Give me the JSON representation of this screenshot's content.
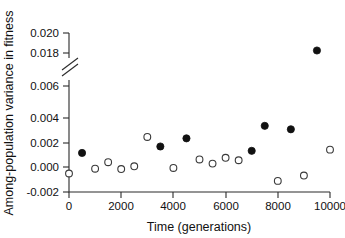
{
  "chart_data": {
    "type": "scatter",
    "title": "",
    "xlabel": "Time (generations)",
    "ylabel": "Among-population variance in fitness",
    "xlim": [
      0,
      10000
    ],
    "xticks": [
      0,
      2000,
      4000,
      6000,
      8000,
      10000
    ],
    "xticklabels": [
      "0",
      "2000",
      "4000",
      "6000",
      "8000",
      "10000"
    ],
    "yticks": [
      -0.002,
      0.0,
      0.002,
      0.004,
      0.006,
      0.018,
      0.02
    ],
    "yticklabels": [
      "-0.002",
      "0.000",
      "0.002",
      "0.004",
      "0.006",
      "0.018",
      "0.020"
    ],
    "y_axis_break": {
      "present": true,
      "between": [
        0.006,
        0.018
      ],
      "symbol": "double-slash"
    },
    "grid": false,
    "legend": null,
    "series": [
      {
        "name": "filled",
        "marker": "filled-circle",
        "color": "#111111",
        "points": [
          {
            "x": 500,
            "y": 0.00222
          },
          {
            "x": 3500,
            "y": 0.00292
          },
          {
            "x": 4500,
            "y": 0.0038
          },
          {
            "x": 7000,
            "y": 0.00245
          },
          {
            "x": 7500,
            "y": 0.00515
          },
          {
            "x": 8500,
            "y": 0.00478
          },
          {
            "x": 9500,
            "y": 0.01825
          }
        ]
      },
      {
        "name": "open",
        "marker": "open-circle",
        "color": "#ffffff",
        "points": [
          {
            "x": 0,
            "y": 0.0
          },
          {
            "x": 1000,
            "y": 0.00052
          },
          {
            "x": 1500,
            "y": 0.00122
          },
          {
            "x": 2000,
            "y": 0.00048
          },
          {
            "x": 2500,
            "y": 0.00078
          },
          {
            "x": 3000,
            "y": 0.00395
          },
          {
            "x": 4000,
            "y": 0.0006
          },
          {
            "x": 5000,
            "y": 0.00152
          },
          {
            "x": 5500,
            "y": 0.00107
          },
          {
            "x": 6000,
            "y": 0.0017
          },
          {
            "x": 6500,
            "y": 0.00143
          },
          {
            "x": 8000,
            "y": -0.0008
          },
          {
            "x": 9000,
            "y": -0.00022
          },
          {
            "x": 10000,
            "y": 0.00258
          }
        ]
      }
    ]
  },
  "axis_geometry": {
    "x_pixel_min": 69,
    "x_pixel_max": 330,
    "y_pixel_bottom": 192,
    "y_pixel_lower_top": 118,
    "y_break_low_pixel": 78,
    "y_break_high_pixel": 60,
    "y_pixel_018": 53,
    "y_pixel_020": 33
  }
}
